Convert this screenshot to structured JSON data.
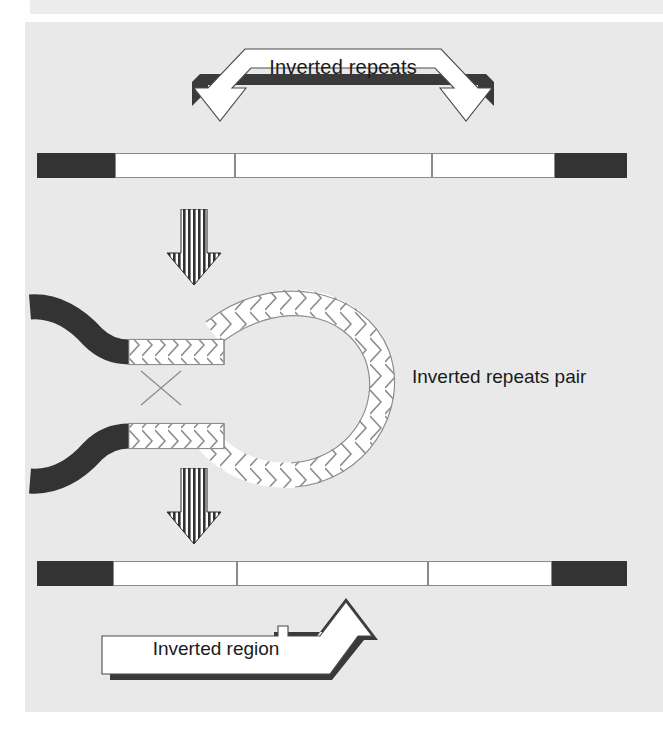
{
  "figure": {
    "title_top": "Inverted repeats",
    "label_middle": "Inverted repeats pair",
    "label_bottom": "Inverted region",
    "colors": {
      "page_background": "#ffffff",
      "panel_background": "#e9e9e9",
      "dna_dark_segment": "#333333",
      "chevron_outline": "#8d8d8d",
      "chevron_fill": "#ffffff",
      "text": "#1a1a1a",
      "shadow": "#3a3a3a"
    },
    "stages": [
      {
        "name": "stage-1-linear-dna",
        "caption": "Inverted repeats",
        "segments": [
          {
            "id": "left-flank",
            "style": "dark",
            "direction": "none"
          },
          {
            "id": "repeat-a",
            "style": "chevron",
            "direction": "right"
          },
          {
            "id": "spacer-right",
            "style": "chevron",
            "direction": "right"
          },
          {
            "id": "repeat-b",
            "style": "chevron",
            "direction": "left"
          },
          {
            "id": "right-flank",
            "style": "dark",
            "direction": "none"
          }
        ]
      },
      {
        "name": "stage-2-loop-pairing",
        "caption": "Inverted repeats pair",
        "elements": [
          {
            "id": "upper-strand-tail",
            "style": "dark",
            "direction": "none"
          },
          {
            "id": "upper-strand-repeat",
            "style": "chevron",
            "direction": "right"
          },
          {
            "id": "lower-strand-tail",
            "style": "dark",
            "direction": "none"
          },
          {
            "id": "lower-strand-repeat",
            "style": "chevron",
            "direction": "right"
          },
          {
            "id": "loop",
            "style": "chevron",
            "direction": "around"
          },
          {
            "id": "crossover-x",
            "style": "line",
            "direction": "none"
          }
        ]
      },
      {
        "name": "stage-3-inverted-dna",
        "caption": "Inverted region",
        "segments": [
          {
            "id": "left-flank",
            "style": "dark",
            "direction": "none"
          },
          {
            "id": "repeat-a",
            "style": "chevron",
            "direction": "right"
          },
          {
            "id": "inverted-spacer",
            "style": "chevron",
            "direction": "left"
          },
          {
            "id": "repeat-b",
            "style": "chevron",
            "direction": "left"
          },
          {
            "id": "right-flank",
            "style": "dark",
            "direction": "none"
          }
        ]
      }
    ],
    "transition_arrows": [
      {
        "id": "arrow-1",
        "direction": "down"
      },
      {
        "id": "arrow-2",
        "direction": "down"
      }
    ]
  }
}
